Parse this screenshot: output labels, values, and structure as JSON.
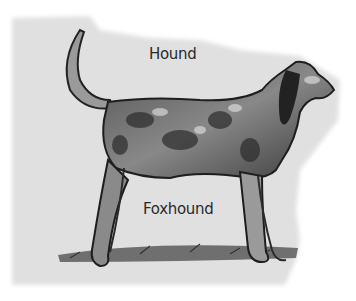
{
  "image": {
    "subject": "Pencil illustration of a standing foxhound dog, side view facing right",
    "labels": {
      "top": "Hound",
      "bottom": "Foxhound"
    },
    "colors": {
      "background_paper": "#e6e6e6",
      "page": "#ffffff",
      "ink": "#2a2a2a"
    }
  }
}
